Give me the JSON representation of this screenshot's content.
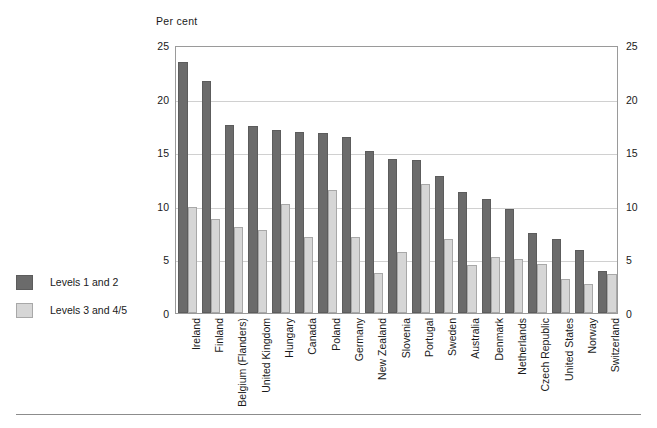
{
  "chart": {
    "unit_label": "Per cent",
    "axis": {
      "ticks": [
        0,
        5,
        10,
        15,
        20,
        25
      ],
      "min": 0,
      "max": 25
    },
    "legend": [
      {
        "key": "s1",
        "label": "Levels 1 and 2"
      },
      {
        "key": "s2",
        "label": "Levels 3 and 4/5"
      }
    ]
  },
  "chart_data": {
    "type": "bar",
    "title": "",
    "xlabel": "",
    "ylabel": "Per cent",
    "ylim": [
      0,
      25
    ],
    "yticks": [
      0,
      5,
      10,
      15,
      20,
      25
    ],
    "grid": true,
    "legend_position": "left-outside",
    "dual_axis": true,
    "categories": [
      "Ireland",
      "Finland",
      "Belgium (Flanders)",
      "United Kingdom",
      "Hungary",
      "Canada",
      "Poland",
      "Germany",
      "New Zealand",
      "Slovenia",
      "Portugal",
      "Sweden",
      "Australia",
      "Denmark",
      "Netherlands",
      "Czech Republic",
      "United States",
      "Norway",
      "Switzerland"
    ],
    "series": [
      {
        "name": "Levels 1 and 2",
        "color": "#6b6b6b",
        "values": [
          23.4,
          21.6,
          17.5,
          17.4,
          17.1,
          16.9,
          16.8,
          16.4,
          15.1,
          14.4,
          14.3,
          12.8,
          11.3,
          10.6,
          9.7,
          7.5,
          6.9,
          5.9,
          3.9
        ]
      },
      {
        "name": "Levels 3 and 4/5",
        "color": "#d6d6d6",
        "values": [
          9.9,
          8.8,
          8.0,
          7.7,
          10.2,
          7.1,
          11.5,
          7.1,
          3.7,
          5.7,
          12.0,
          6.9,
          4.5,
          5.2,
          5.0,
          4.6,
          3.2,
          2.7,
          3.6
        ]
      }
    ]
  }
}
